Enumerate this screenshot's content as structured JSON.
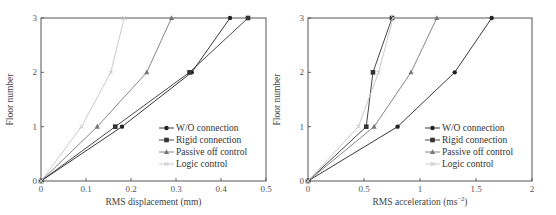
{
  "chart_data": [
    {
      "type": "line",
      "title": "",
      "xlabel": "RMS displacement (mm)",
      "ylabel": "Floor number",
      "xlim": [
        0,
        0.5
      ],
      "ylim": [
        0,
        3
      ],
      "xticks": [
        "0",
        "0.1",
        "0.2",
        "0.3",
        "0.4",
        "0.5"
      ],
      "yticks": [
        "0",
        "1",
        "2",
        "3"
      ],
      "grid": false,
      "legend_position": "lower right",
      "y": [
        0,
        1,
        2,
        3
      ],
      "series": [
        {
          "name": "W/O connection",
          "marker": "circle",
          "color": "#222222",
          "values": [
            0,
            0.18,
            0.335,
            0.42
          ]
        },
        {
          "name": "Rigid connection",
          "marker": "square",
          "color": "#333333",
          "values": [
            0,
            0.165,
            0.33,
            0.46
          ]
        },
        {
          "name": "Passive off control",
          "marker": "triangle",
          "color": "#777777",
          "values": [
            0,
            0.125,
            0.235,
            0.29
          ]
        },
        {
          "name": "Logic control",
          "marker": "cross",
          "color": "#c4c4c4",
          "values": [
            0,
            0.09,
            0.155,
            0.185
          ]
        }
      ]
    },
    {
      "type": "line",
      "title": "",
      "xlabel": "RMS acceleration (ms",
      "xlabel_sup": "−2",
      "xlabel_end": ")",
      "ylabel": "Floor number",
      "xlim": [
        0,
        2
      ],
      "ylim": [
        0,
        3
      ],
      "xticks": [
        "0",
        "0.5",
        "1",
        "1.5",
        "2"
      ],
      "yticks": [
        "0",
        "1",
        "2",
        "3"
      ],
      "grid": false,
      "legend_position": "lower right",
      "y": [
        0,
        1,
        2,
        3
      ],
      "series": [
        {
          "name": "W/O connection",
          "marker": "circle",
          "color": "#222222",
          "values": [
            0,
            0.8,
            1.31,
            1.64
          ]
        },
        {
          "name": "Rigid connection",
          "marker": "square",
          "color": "#333333",
          "values": [
            0,
            0.52,
            0.58,
            0.75
          ]
        },
        {
          "name": "Passive off control",
          "marker": "triangle",
          "color": "#777777",
          "values": [
            0,
            0.59,
            0.92,
            1.15
          ]
        },
        {
          "name": "Logic control",
          "marker": "cross",
          "color": "#c4c4c4",
          "values": [
            0,
            0.45,
            0.63,
            0.76
          ]
        }
      ]
    }
  ]
}
